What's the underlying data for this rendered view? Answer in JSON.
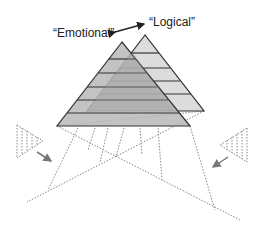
{
  "labels": {
    "emotional": "“Emotional”",
    "logical": "“Logical”"
  },
  "colors": {
    "emotional_fill": "#b9b9b9",
    "logical_fill": "#dcdcdc",
    "overlap_fill": "#a6a6a6",
    "stroke": "#333333",
    "dotted": "#888888",
    "arrow": "#777777"
  },
  "pyramids": [
    {
      "name": "Emotional",
      "levels": 6
    },
    {
      "name": "Logical",
      "levels": 6
    }
  ]
}
